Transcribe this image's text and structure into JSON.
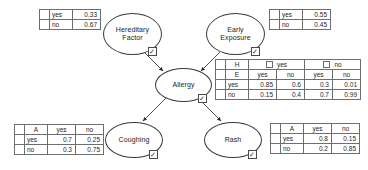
{
  "diagram": {
    "type": "bayesian-network",
    "nodes": [
      {
        "id": "hereditary",
        "label": "Hereditary\nFactor",
        "label_line1": "Hereditary",
        "label_line2": "Factor",
        "checkbox": "✓"
      },
      {
        "id": "early",
        "label": "Early\nExposure",
        "label_line1": "Early",
        "label_line2": "Exposure",
        "checkbox": "✓"
      },
      {
        "id": "allergy",
        "label": "Allergy",
        "label_line1": "Allergy",
        "label_line2": "",
        "checkbox": "✓"
      },
      {
        "id": "coughing",
        "label": "Coughing",
        "label_line1": "Coughing",
        "label_line2": "",
        "checkbox": "✓"
      },
      {
        "id": "rash",
        "label": "Rash",
        "label_line1": "Rash",
        "label_line2": "",
        "checkbox": "✓"
      }
    ],
    "edges": [
      {
        "from": "hereditary",
        "to": "allergy"
      },
      {
        "from": "early",
        "to": "allergy"
      },
      {
        "from": "allergy",
        "to": "coughing"
      },
      {
        "from": "allergy",
        "to": "rash"
      }
    ]
  },
  "tables": {
    "hereditary_prior": {
      "rows": [
        {
          "state": "yes",
          "prob": "0.33"
        },
        {
          "state": "no",
          "prob": "0.67"
        }
      ]
    },
    "early_prior": {
      "rows": [
        {
          "state": "yes",
          "prob": "0.55"
        },
        {
          "state": "no",
          "prob": "0.45"
        }
      ]
    },
    "allergy_cpt": {
      "parent_h_label": "H",
      "parent_e_label": "E",
      "h_states": [
        "yes",
        "no"
      ],
      "e_states": [
        "yes",
        "no",
        "yes",
        "no"
      ],
      "rows": [
        {
          "state": "yes",
          "values": [
            "0.85",
            "0.6",
            "0.3",
            "0.01"
          ]
        },
        {
          "state": "no",
          "values": [
            "0.15",
            "0.4",
            "0.7",
            "0.99"
          ]
        }
      ]
    },
    "coughing_cpt": {
      "parent_label": "A",
      "columns": [
        "yes",
        "no"
      ],
      "rows": [
        {
          "state": "yes",
          "values": [
            "0.7",
            "0.25"
          ]
        },
        {
          "state": "no",
          "values": [
            "0.3",
            "0.75"
          ]
        }
      ]
    },
    "rash_cpt": {
      "parent_label": "A",
      "columns": [
        "yes",
        "no"
      ],
      "rows": [
        {
          "state": "yes",
          "values": [
            "0.8",
            "0.15"
          ]
        },
        {
          "state": "no",
          "values": [
            "0.2",
            "0.85"
          ]
        }
      ]
    }
  },
  "colors": {
    "stroke": "#3a3a3a",
    "table_border": "#6e6e6e",
    "text": "#1f1f1f",
    "background": "#ffffff"
  }
}
